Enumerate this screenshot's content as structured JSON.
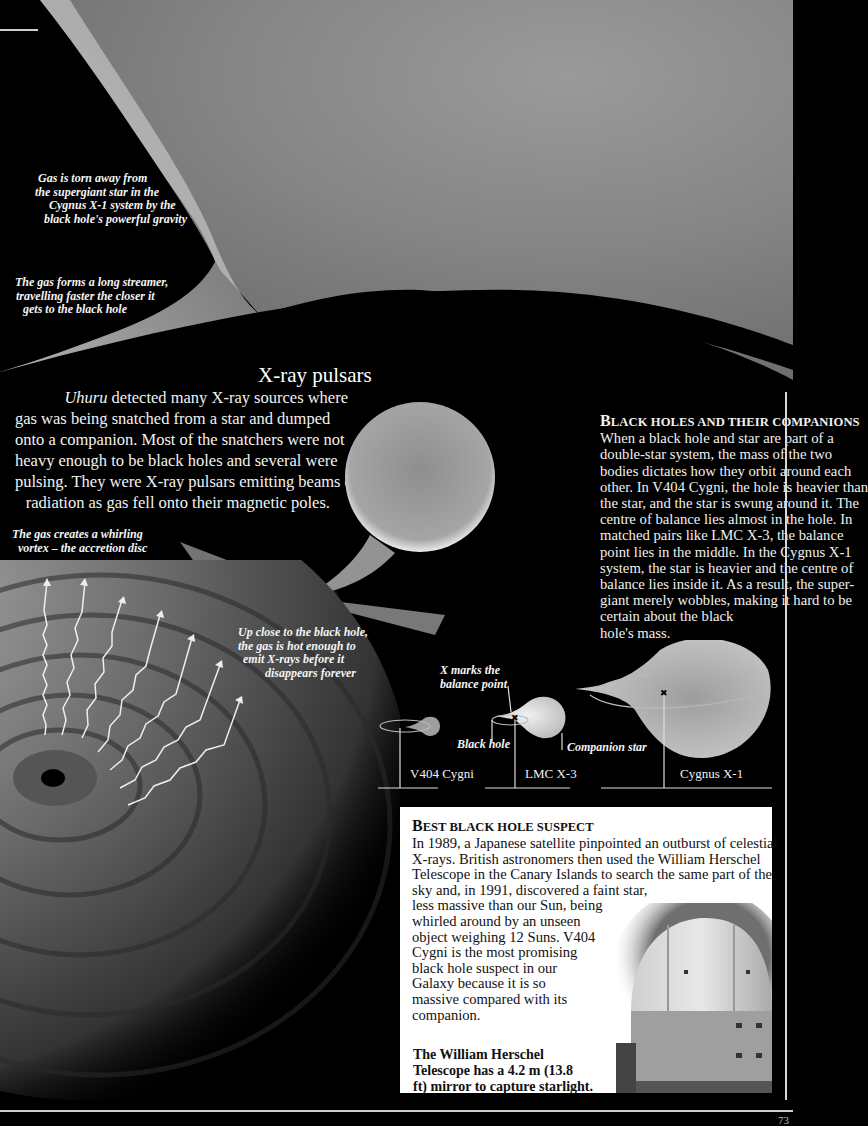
{
  "captions": {
    "torn": [
      "Gas is torn away from",
      "the supergiant star in the",
      "Cygnus X-1 system by the",
      "black hole's powerful gravity"
    ],
    "streamer": [
      "The gas forms a long streamer,",
      "travelling faster the closer it",
      "gets to the black hole"
    ],
    "vortex": [
      "The gas creates a whirling",
      "vortex – the accretion disc"
    ],
    "upclose": [
      "Up close to the black hole,",
      "the gas is hot enough to",
      "emit X-rays before it",
      "disappears forever"
    ]
  },
  "pulsars": {
    "title": "X-ray pulsars",
    "italic_lead": "Uhuru",
    "lines": [
      " detected many X-ray sources where",
      "gas was being snatched from a star and dumped",
      "onto a companion. Most of the snatchers were not",
      "heavy enough to be black holes and several were",
      "pulsing. They were X-ray pulsars emitting beams of",
      "radiation as gas fell onto their magnetic poles."
    ]
  },
  "companions": {
    "heading_first": "B",
    "heading_rest": "LACK HOLES AND THEIR COMPANIONS",
    "lines": [
      "When a black hole and star are part of a",
      "double-star system, the mass of the two",
      "bodies dictates how they orbit around each",
      "other. In V404 Cygni, the hole is heavier than",
      "the star, and the star is swung around it. The",
      "centre of balance lies almost in the hole. In",
      "matched pairs like LMC X-3, the balance",
      "point lies in the middle. In the Cygnus X-1",
      "system, the star is heavier and the centre of",
      "balance lies inside it. As a result, the super-",
      "giant merely wobbles, making it hard to be",
      "certain about the black",
      "hole's mass."
    ]
  },
  "diagram": {
    "x_marks": [
      "X marks the",
      "balance point"
    ],
    "black_hole_label": "Black hole",
    "companion_label": "Companion star",
    "systems": [
      "V404 Cygni",
      "LMC X-3",
      "Cygnus X-1"
    ]
  },
  "suspect": {
    "heading_first": "B",
    "heading_rest_1": "EST BLACK HOLE SUSPECT",
    "lines": [
      "In 1989, a Japanese satellite pinpointed an outburst of celestial",
      "X-rays. British astronomers then used the William Herschel",
      "Telescope in the Canary Islands to search the same part of the",
      "sky and, in 1991, discovered a faint star,",
      "less massive than our Sun, being",
      "whirled around by an unseen",
      "object weighing 12 Suns. V404",
      "Cygni is the most promising",
      "black hole suspect in our",
      "Galaxy because it is so",
      "massive compared with its",
      "companion."
    ],
    "caption": [
      "The William Herschel",
      "Telescope has a 4.2 m (13.8",
      "ft) mirror to capture starlight."
    ]
  },
  "page_number": "73"
}
